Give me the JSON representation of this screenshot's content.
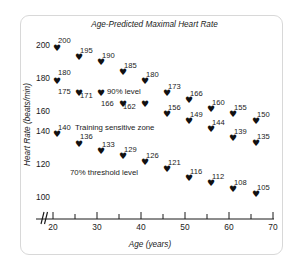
{
  "figure": {
    "title": "Age-Predicted Maximal Heart Rate",
    "xlabel": "Age (years)",
    "ylabel": "Heart Rate (beats/min)"
  },
  "annotations": {
    "upper": "90% level",
    "middle": "Training sensitive zone",
    "lower": "70% threshold level"
  },
  "axes": {
    "x_ticks": [
      "20",
      "30",
      "40",
      "50",
      "60",
      "70"
    ],
    "y_ticks": [
      "200",
      "180",
      "160",
      "140",
      "120",
      "100"
    ],
    "axis_break": "axis-break-icon"
  },
  "chart_data": {
    "type": "scatter",
    "title": "Age-Predicted Maximal Heart Rate",
    "xlabel": "Age (years)",
    "ylabel": "Heart Rate (beats/min)",
    "xlim": [
      18,
      70
    ],
    "ylim": [
      95,
      207
    ],
    "grid": false,
    "legend": "none",
    "x_ticks": [
      20,
      30,
      40,
      50,
      60,
      70
    ],
    "y_ticks": [
      100,
      120,
      140,
      160,
      180,
      200
    ],
    "x_minor_ticks": [
      25,
      35,
      45,
      55,
      65
    ],
    "marker": "heart",
    "x": [
      20,
      25,
      30,
      35,
      40,
      45,
      50,
      55,
      60,
      65
    ],
    "series": [
      {
        "name": "Age-predicted maximal heart rate (90% level)",
        "annotation": "90% level",
        "values": [
          200,
          195,
          190,
          185,
          180,
          173,
          166,
          160,
          155,
          150
        ]
      },
      {
        "name": "Training sensitive zone upper bound",
        "annotation": "Training sensitive zone",
        "values": [
          180,
          175,
          171,
          166,
          162,
          156,
          149,
          144,
          139,
          135
        ]
      },
      {
        "name": "70% threshold level",
        "annotation": "70% threshold level",
        "values": [
          140,
          136,
          133,
          129,
          126,
          121,
          116,
          112,
          108,
          105
        ]
      }
    ],
    "points": [
      {
        "x": 20,
        "y": 200,
        "label": "200",
        "series": 0,
        "px": 53,
        "py": 44,
        "lx": 58,
        "ly": 37
      },
      {
        "x": 25,
        "y": 195,
        "label": "195",
        "series": 0,
        "px": 75,
        "py": 53,
        "lx": 80,
        "ly": 47
      },
      {
        "x": 30,
        "y": 190,
        "label": "190",
        "series": 0,
        "px": 97,
        "py": 58,
        "lx": 102,
        "ly": 52
      },
      {
        "x": 35,
        "y": 185,
        "label": "185",
        "series": 0,
        "px": 119,
        "py": 68,
        "lx": 124,
        "ly": 62
      },
      {
        "x": 40,
        "y": 180,
        "label": "180",
        "series": 0,
        "px": 141,
        "py": 77,
        "lx": 146,
        "ly": 71
      },
      {
        "x": 45,
        "y": 173,
        "label": "173",
        "series": 0,
        "px": 163,
        "py": 89,
        "lx": 168,
        "ly": 83
      },
      {
        "x": 50,
        "y": 166,
        "label": "166",
        "series": 0,
        "px": 185,
        "py": 96,
        "lx": 190,
        "ly": 90
      },
      {
        "x": 55,
        "y": 160,
        "label": "160",
        "series": 0,
        "px": 207,
        "py": 105,
        "lx": 212,
        "ly": 99
      },
      {
        "x": 60,
        "y": 155,
        "label": "155",
        "series": 0,
        "px": 229,
        "py": 110,
        "lx": 234,
        "ly": 104
      },
      {
        "x": 65,
        "y": 150,
        "label": "150",
        "series": 0,
        "px": 252,
        "py": 117,
        "lx": 257,
        "ly": 111
      },
      {
        "x": 20,
        "y": 180,
        "label": "180",
        "series": 1,
        "px": 53,
        "py": 77,
        "lx": 58,
        "ly": 69
      },
      {
        "x": 25,
        "y": 175,
        "label": "175",
        "series": 1,
        "px": 75,
        "py": 89,
        "lx": 58,
        "ly": 88
      },
      {
        "x": 30,
        "y": 171,
        "label": "171",
        "series": 1,
        "px": 97,
        "py": 89,
        "lx": 80,
        "ly": 92
      },
      {
        "x": 35,
        "y": 166,
        "label": "166",
        "series": 1,
        "px": 119,
        "py": 100,
        "lx": 101,
        "ly": 100
      },
      {
        "x": 40,
        "y": 162,
        "label": "162",
        "series": 1,
        "px": 141,
        "py": 100,
        "lx": 123,
        "ly": 103
      },
      {
        "x": 45,
        "y": 156,
        "label": "156",
        "series": 1,
        "px": 163,
        "py": 110,
        "lx": 168,
        "ly": 104
      },
      {
        "x": 50,
        "y": 149,
        "label": "149",
        "series": 1,
        "px": 185,
        "py": 117,
        "lx": 190,
        "ly": 111
      },
      {
        "x": 55,
        "y": 144,
        "label": "144",
        "series": 1,
        "px": 207,
        "py": 125,
        "lx": 212,
        "ly": 119
      },
      {
        "x": 60,
        "y": 139,
        "label": "139",
        "series": 1,
        "px": 229,
        "py": 134,
        "lx": 234,
        "ly": 128
      },
      {
        "x": 65,
        "y": 135,
        "label": "135",
        "series": 1,
        "px": 252,
        "py": 139,
        "lx": 257,
        "ly": 133
      },
      {
        "x": 20,
        "y": 140,
        "label": "140",
        "series": 2,
        "px": 53,
        "py": 130,
        "lx": 58,
        "ly": 124
      },
      {
        "x": 25,
        "y": 136,
        "label": "136",
        "series": 2,
        "px": 75,
        "py": 140,
        "lx": 80,
        "ly": 133
      },
      {
        "x": 30,
        "y": 133,
        "label": "133",
        "series": 2,
        "px": 97,
        "py": 147,
        "lx": 102,
        "ly": 141
      },
      {
        "x": 35,
        "y": 129,
        "label": "129",
        "series": 2,
        "px": 119,
        "py": 152,
        "lx": 124,
        "ly": 146
      },
      {
        "x": 40,
        "y": 126,
        "label": "126",
        "series": 2,
        "px": 141,
        "py": 158,
        "lx": 146,
        "ly": 152
      },
      {
        "x": 45,
        "y": 121,
        "label": "121",
        "series": 2,
        "px": 163,
        "py": 165,
        "lx": 168,
        "ly": 159
      },
      {
        "x": 50,
        "y": 116,
        "label": "116",
        "series": 2,
        "px": 185,
        "py": 174,
        "lx": 190,
        "ly": 168
      },
      {
        "x": 55,
        "y": 112,
        "label": "112",
        "series": 2,
        "px": 207,
        "py": 179,
        "lx": 212,
        "ly": 173
      },
      {
        "x": 60,
        "y": 108,
        "label": "108",
        "series": 2,
        "px": 229,
        "py": 185,
        "lx": 234,
        "ly": 179
      },
      {
        "x": 65,
        "y": 105,
        "label": "105",
        "series": 2,
        "px": 252,
        "py": 190,
        "lx": 257,
        "ly": 184
      }
    ]
  }
}
